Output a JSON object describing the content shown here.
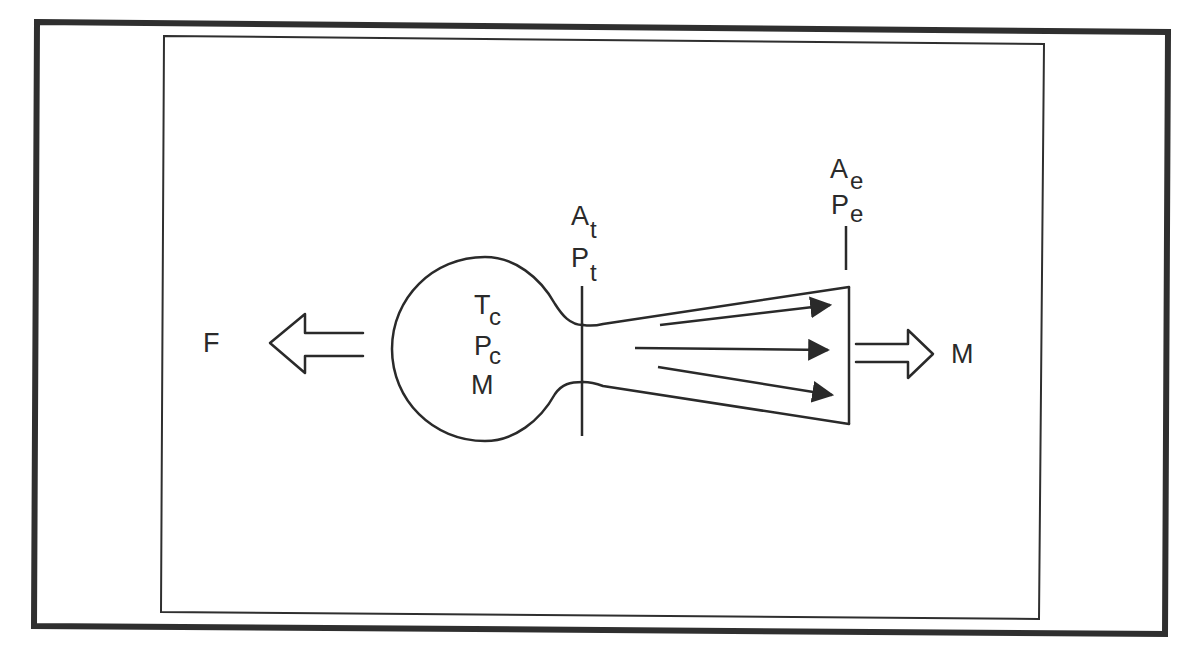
{
  "diagram": {
    "colors": {
      "line": "#2a2a2a",
      "background": "#ffffff"
    },
    "labels": {
      "force": "F",
      "chamber_temp": {
        "main": "T",
        "sub": "c"
      },
      "chamber_pressure": {
        "main": "P",
        "sub": "c"
      },
      "chamber_mass": "M",
      "throat_area": {
        "main": "A",
        "sub": "t"
      },
      "throat_pressure": {
        "main": "P",
        "sub": "t"
      },
      "exit_area": {
        "main": "A",
        "sub": "e"
      },
      "exit_pressure": {
        "main": "P",
        "sub": "e"
      },
      "exit_mass": "M"
    },
    "elements": [
      {
        "name": "force-arrow",
        "direction": "left",
        "style": "hollow"
      },
      {
        "name": "combustion-chamber",
        "shape": "circle"
      },
      {
        "name": "throat-plane",
        "shape": "vertical-line"
      },
      {
        "name": "nozzle",
        "shape": "diverging-cone"
      },
      {
        "name": "flow-arrows",
        "count": 3
      },
      {
        "name": "exit-plane-marker",
        "shape": "vertical-line"
      },
      {
        "name": "mass-flow-arrow",
        "direction": "right",
        "style": "hollow"
      }
    ]
  }
}
